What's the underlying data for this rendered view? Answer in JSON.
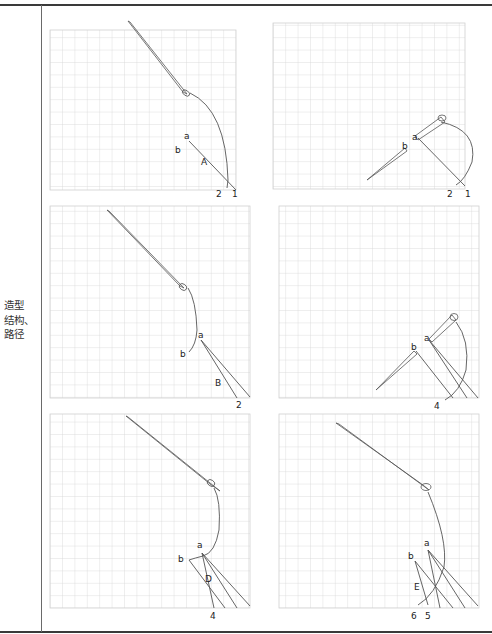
{
  "row_label": {
    "line1": "造型",
    "line2": "结构、",
    "line3": "路径"
  },
  "panels": [
    {
      "id": 1,
      "labels": {
        "a": "a",
        "b": "b",
        "region": "A",
        "n1": "2",
        "n2": "1"
      }
    },
    {
      "id": 2,
      "labels": {
        "a": "a",
        "b": "b",
        "n1": "2",
        "n2": "1"
      }
    },
    {
      "id": 3,
      "labels": {
        "a": "a",
        "b": "b",
        "region": "B",
        "n1": "2"
      }
    },
    {
      "id": 4,
      "labels": {
        "a": "a",
        "b": "b",
        "n1": "4"
      }
    },
    {
      "id": 5,
      "labels": {
        "a": "a",
        "b": "b",
        "region": "D",
        "n1": "4"
      }
    },
    {
      "id": 6,
      "labels": {
        "a": "a",
        "b": "b",
        "region": "E",
        "n1": "6",
        "n2": "5"
      }
    }
  ],
  "colors": {
    "grid": "#d4d4d4",
    "stroke": "#555555",
    "frame": "#3a3a3a"
  }
}
